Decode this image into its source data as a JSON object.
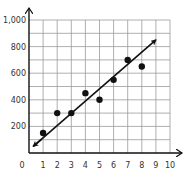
{
  "chart_data": {
    "type": "scatter",
    "title": "",
    "xlabel": "",
    "ylabel": "",
    "xlim": [
      0,
      10
    ],
    "ylim": [
      0,
      1000
    ],
    "grid": true,
    "x_ticks": [
      "0",
      "1",
      "2",
      "3",
      "4",
      "5",
      "6",
      "7",
      "8",
      "9",
      "10"
    ],
    "y_ticks": [
      "200",
      "400",
      "600",
      "800",
      "1,000"
    ],
    "series": [
      {
        "name": "data points",
        "points": [
          {
            "x": 1,
            "y": 150
          },
          {
            "x": 2,
            "y": 300
          },
          {
            "x": 3,
            "y": 300
          },
          {
            "x": 4,
            "y": 450
          },
          {
            "x": 5,
            "y": 400
          },
          {
            "x": 6,
            "y": 550
          },
          {
            "x": 7,
            "y": 700
          },
          {
            "x": 8,
            "y": 650
          }
        ]
      }
    ],
    "trend_line": {
      "name": "line of best fit",
      "start": {
        "x": 0.3,
        "y": 50
      },
      "end": {
        "x": 9,
        "y": 850
      },
      "arrows": "both"
    },
    "legend": null
  },
  "colors": {
    "axis": "#111111",
    "grid": "#9a9a9a",
    "points": "#111111",
    "line": "#111111",
    "text": "#333333"
  }
}
